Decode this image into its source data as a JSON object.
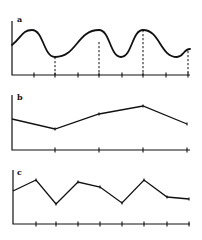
{
  "figure": {
    "panels": [
      {
        "label": "a",
        "kind": "sinusoid",
        "origin": [
          12,
          75
        ],
        "axis_top": 21,
        "axis_right": 190,
        "curve_start": [
          12,
          45
        ],
        "peaks_x": [
          32,
          99,
          143
        ],
        "troughs_x": [
          55,
          121,
          177
        ],
        "peak_y": 30,
        "trough_y": 57,
        "curve_end": [
          190,
          49
        ],
        "ticks_x": [
          34,
          55,
          78,
          99,
          122,
          143,
          166,
          188
        ],
        "dashed_x": [
          55,
          99,
          143,
          188
        ],
        "dashed_y": [
          57,
          42,
          30,
          51
        ]
      },
      {
        "label": "b",
        "kind": "polyline",
        "origin": [
          12,
          150
        ],
        "axis_top": 95,
        "axis_right": 190,
        "points": [
          [
            12,
            119
          ],
          [
            55,
            129
          ],
          [
            99,
            114
          ],
          [
            143,
            106
          ],
          [
            187,
            124
          ]
        ],
        "ticks_x": [
          55,
          99,
          143,
          187
        ]
      },
      {
        "label": "c",
        "kind": "polyline",
        "origin": [
          13,
          224
        ],
        "axis_top": 170,
        "axis_right": 190,
        "points": [
          [
            13,
            191
          ],
          [
            36,
            180
          ],
          [
            56,
            204
          ],
          [
            78,
            182
          ],
          [
            100,
            187
          ],
          [
            122,
            203
          ],
          [
            144,
            180
          ],
          [
            167,
            197
          ],
          [
            189,
            199
          ]
        ],
        "ticks_x": [
          36,
          56,
          78,
          100,
          122,
          144,
          167,
          189
        ]
      }
    ],
    "colors": {
      "ink": "#111111",
      "background": "#ffffff"
    }
  }
}
